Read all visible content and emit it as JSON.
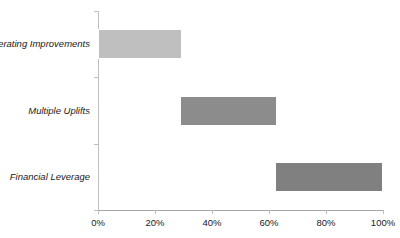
{
  "chart_data": {
    "type": "bar",
    "orientation": "horizontal",
    "subtype": "cascade-waterfall",
    "title": "Contribution to Returns",
    "xlabel": "",
    "ylabel": "",
    "categories": [
      "Operating Improvements",
      "Multiple Uplifts",
      "Financial Leverage"
    ],
    "bars": [
      {
        "label": "Operating Improvements",
        "start": 0,
        "end": 29.5,
        "value": 29.5,
        "color": "#bfbfbf"
      },
      {
        "label": "Multiple Uplifts",
        "start": 28.9,
        "end": 62.7,
        "value": 33.8,
        "color": "#8c8c8c"
      },
      {
        "label": "Financial Leverage",
        "start": 62.0,
        "end": 100.0,
        "value": 38.0,
        "color": "#808080"
      }
    ],
    "xlim": [
      0,
      100
    ],
    "xticks": [
      0,
      20,
      40,
      60,
      80,
      100
    ],
    "xtick_labels": [
      "0%",
      "20%",
      "40%",
      "60%",
      "80%",
      "100%"
    ],
    "grid": false,
    "legend": false,
    "axis_color": "#bfbfbf",
    "text_color": "#1a1a1a"
  }
}
